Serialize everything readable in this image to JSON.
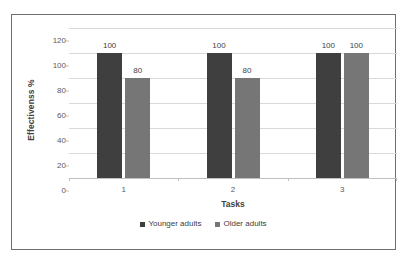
{
  "chart_data": {
    "type": "bar",
    "title": "",
    "xlabel": "Tasks",
    "ylabel": "Effectivenss %",
    "categories": [
      "1",
      "2",
      "3"
    ],
    "series": [
      {
        "name": "Younger adults",
        "color": "#3f3f3f",
        "values": [
          100,
          100,
          100
        ]
      },
      {
        "name": "Older adults",
        "color": "#767676",
        "values": [
          80,
          80,
          100
        ]
      }
    ],
    "ylim": [
      0,
      120
    ],
    "yticks": [
      0,
      20,
      40,
      60,
      80,
      100,
      120
    ],
    "ytick_labels": [
      "0",
      "20",
      "40",
      "60",
      "80",
      "100",
      "120"
    ],
    "data_labels": [
      [
        "100",
        "80"
      ],
      [
        "100",
        "80"
      ],
      [
        "100",
        "100"
      ]
    ],
    "grid": true,
    "legend_position": "bottom",
    "border_color": "#6f6f6f",
    "gridline_color": "#d9d9d9",
    "background": "#ffffff"
  }
}
